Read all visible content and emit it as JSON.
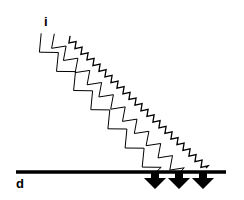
{
  "diagram": {
    "labels": {
      "incident": "i",
      "surface": "d"
    },
    "waves": [
      {
        "name": "long-wavelength",
        "start": [
          36,
          38
        ],
        "end": [
          156,
          172
        ],
        "amplitude": 7,
        "segments": 14
      },
      {
        "name": "medium-wavelength",
        "start": [
          50,
          38
        ],
        "end": [
          180,
          172
        ],
        "amplitude": 6,
        "segments": 22
      },
      {
        "name": "short-wavelength",
        "start": [
          68,
          38
        ],
        "end": [
          206,
          168
        ],
        "amplitude": 3,
        "segments": 46
      }
    ],
    "arrows_count": 3,
    "colors": {
      "stroke": "#000000",
      "background": "#ffffff"
    }
  }
}
